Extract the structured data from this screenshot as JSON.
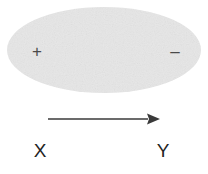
{
  "figure": {
    "background_color": "#ffffff"
  },
  "body": {
    "shape": "ellipse",
    "fill_color": "#e7e7e7",
    "center_x": 104,
    "center_y": 50,
    "radius_x": 97,
    "radius_y": 43
  },
  "charges": {
    "positive": {
      "symbol": "+",
      "name": "positive-charge",
      "x": 37,
      "y": 51,
      "color": "#4a4a4a"
    },
    "negative": {
      "symbol": "–",
      "name": "negative-charge",
      "x": 175,
      "y": 51,
      "color": "#4a4a4a"
    }
  },
  "arrow": {
    "name": "direction-arrow",
    "start_x": 48,
    "end_x": 160,
    "y": 119,
    "color": "#3a3a3a",
    "stroke_width": 1.4,
    "head_length": 13,
    "head_half_width": 5.5
  },
  "labels": {
    "left": {
      "text": "X",
      "x": 40,
      "y": 150,
      "color": "#232323"
    },
    "right": {
      "text": "Y",
      "x": 163,
      "y": 150,
      "color": "#232323"
    }
  }
}
